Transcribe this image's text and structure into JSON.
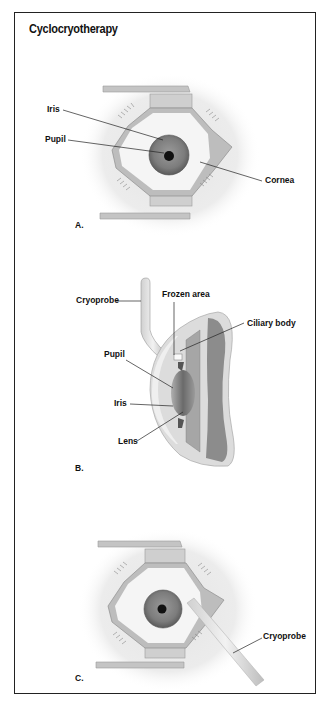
{
  "figure": {
    "title": "Cyclocryotherapy",
    "panels": [
      {
        "id": "A",
        "label": "A.",
        "view": "front view of eye held open by lid speculum",
        "callouts": [
          "Iris",
          "Pupil",
          "Cornea"
        ]
      },
      {
        "id": "B",
        "label": "B.",
        "view": "cross-section of eye with cryoprobe applied",
        "callouts": [
          "Cryoprobe",
          "Frozen area",
          "Ciliary body",
          "Pupil",
          "Iris",
          "Lens"
        ]
      },
      {
        "id": "C",
        "label": "C.",
        "view": "front view of eye with cryoprobe applied",
        "callouts": [
          "Cryoprobe"
        ]
      }
    ]
  },
  "colors": {
    "border": "#222222",
    "text": "#111111",
    "iris": "#7a7a7a",
    "pupil": "#111111",
    "sclera": "#f4f4f4",
    "skin": "#e6e6e6",
    "speculum": "#b8b8b8"
  }
}
